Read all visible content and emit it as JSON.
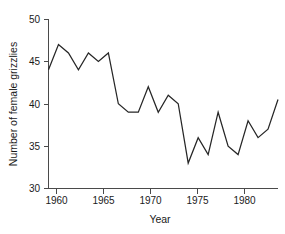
{
  "chart_data": {
    "type": "line",
    "title": "",
    "xlabel": "Year",
    "ylabel": "Number of female grizzlies",
    "xlim": [
      1959,
      1982
    ],
    "ylim": [
      30,
      50
    ],
    "xticks": [
      1960,
      1965,
      1970,
      1975,
      1980
    ],
    "xtick_labels": [
      "1960",
      "1965",
      "1970",
      "1975",
      "1980"
    ],
    "yticks": [
      30,
      35,
      40,
      45,
      50
    ],
    "ytick_labels": [
      "30",
      "35",
      "40",
      "45",
      "50"
    ],
    "grid": false,
    "legend": null,
    "line_color": "#262626",
    "axis_color": "#4a4a4a",
    "background_color": "#ffffff",
    "x": [
      1959,
      1960,
      1961,
      1962,
      1963,
      1964,
      1965,
      1966,
      1967,
      1968,
      1969,
      1970,
      1971,
      1972,
      1973,
      1974,
      1975,
      1976,
      1977,
      1978,
      1979,
      1980,
      1981,
      1982
    ],
    "values": [
      44,
      47,
      46,
      44,
      46,
      45,
      46,
      40,
      39,
      39,
      42,
      39,
      41,
      40,
      33,
      36,
      34,
      39,
      35,
      34,
      38,
      36,
      37,
      40.5
    ],
    "series": [
      {
        "name": "Number of female grizzlies",
        "values": [
          44,
          47,
          46,
          44,
          46,
          45,
          46,
          40,
          39,
          39,
          42,
          39,
          41,
          40,
          33,
          36,
          34,
          39,
          35,
          34,
          38,
          36,
          37,
          40.5
        ]
      }
    ]
  },
  "figure": {
    "ylabel": "Number of female grizzlies",
    "xlabel": "Year"
  }
}
